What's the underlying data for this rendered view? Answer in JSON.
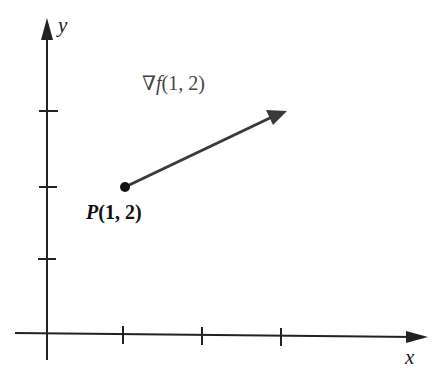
{
  "diagram": {
    "x_axis_label": "x",
    "y_axis_label": "y",
    "point_label_name": "P",
    "point_label_coords": "(1, 2)",
    "vector_label_symbol": "∇f",
    "vector_label_coords": "(1, 2)",
    "point": {
      "x": 1,
      "y": 2
    },
    "x_ticks": [
      1,
      2,
      3
    ],
    "y_ticks": [
      1,
      2,
      3
    ],
    "colors": {
      "axis": "#222222",
      "vector": "#3a3a3a",
      "point": "#111111"
    }
  }
}
